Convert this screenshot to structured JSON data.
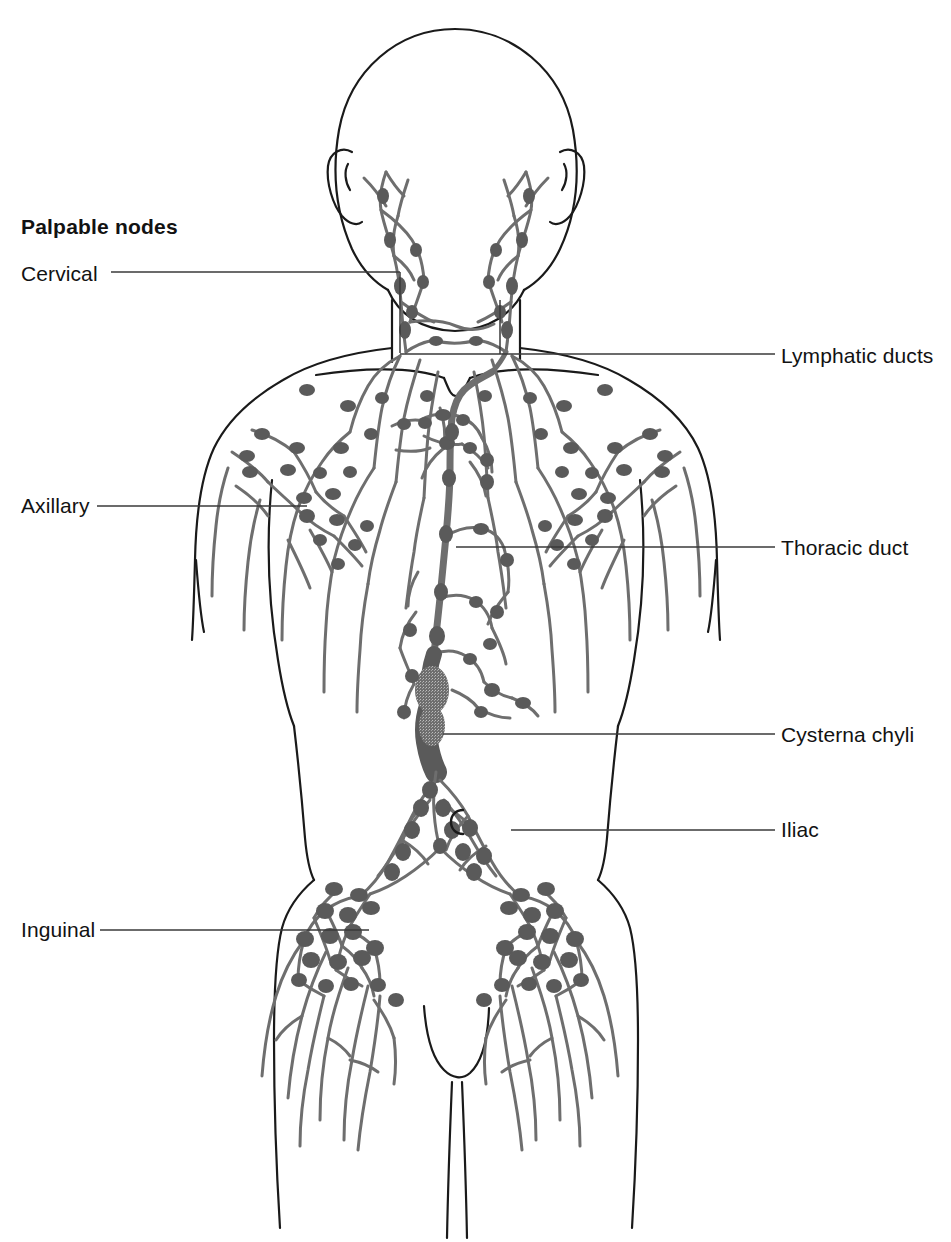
{
  "figure": {
    "heading": "Palpable nodes",
    "colors": {
      "outline": "#1a1a1a",
      "lymph_vessel": "#6b6b6b",
      "lymph_node": "#5a5a5a",
      "leader_line": "#3a3a3a",
      "background": "#ffffff",
      "text": "#121212"
    }
  },
  "labels": {
    "left": [
      {
        "id": "cervical",
        "text": "Cervical"
      },
      {
        "id": "axillary",
        "text": "Axillary"
      },
      {
        "id": "inguinal",
        "text": "Inguinal"
      }
    ],
    "right": [
      {
        "id": "lymphatic-ducts",
        "text": "Lymphatic ducts"
      },
      {
        "id": "thoracic-duct",
        "text": "Thoracic duct"
      },
      {
        "id": "cysterna-chyli",
        "text": "Cysterna chyli"
      },
      {
        "id": "iliac",
        "text": "Iliac"
      }
    ]
  }
}
